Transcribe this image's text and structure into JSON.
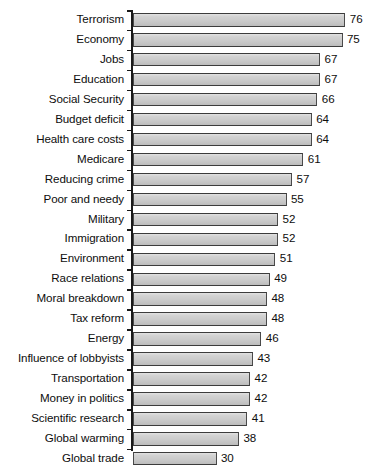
{
  "chart": {
    "type": "bar",
    "orientation": "horizontal",
    "background_color": "#ffffff",
    "bar_fill_color": "#cbcbcb",
    "bar_border_color": "#4a4a4a",
    "axis_color": "#1a1a1a",
    "text_color": "#0d0d0d"
  },
  "chart_data": {
    "type": "bar",
    "title": "",
    "subtitle": "",
    "xlabel": "",
    "ylabel": "",
    "orientation": "horizontal",
    "grid": false,
    "legend": false,
    "xlim": [
      0,
      80
    ],
    "value_labels_shown": true,
    "categories": [
      "Terrorism",
      "Economy",
      "Jobs",
      "Education",
      "Social Security",
      "Budget deficit",
      "Health care costs",
      "Medicare",
      "Reducing crime",
      "Poor and needy",
      "Military",
      "Immigration",
      "Environment",
      "Race relations",
      "Moral breakdown",
      "Tax reform",
      "Energy",
      "Influence of lobbyists",
      "Transportation",
      "Money in politics",
      "Scientific research",
      "Global warming",
      "Global trade"
    ],
    "values": [
      76,
      75,
      67,
      67,
      66,
      64,
      64,
      61,
      57,
      55,
      52,
      52,
      51,
      49,
      48,
      48,
      46,
      43,
      42,
      42,
      41,
      38,
      30
    ]
  }
}
